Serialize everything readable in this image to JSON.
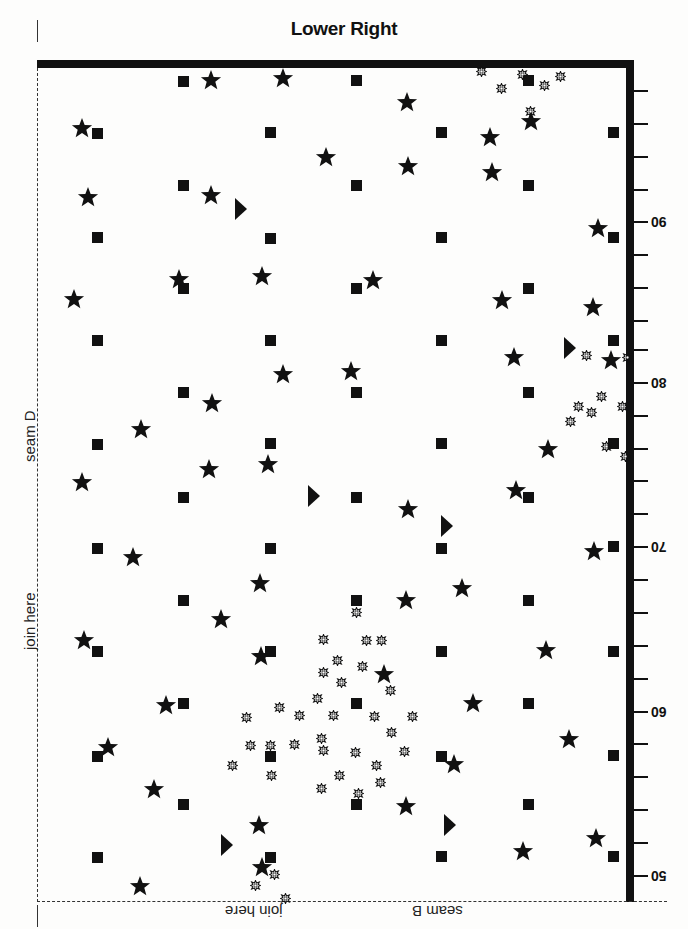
{
  "title": "Lower Right",
  "labels": {
    "left_seam": "seam D",
    "left_join": "join here",
    "bottom_join": "join here",
    "bottom_seam": "seam B"
  },
  "colors": {
    "ink": "#111111",
    "paper": "#fdfdfc"
  },
  "axis": {
    "side": "right",
    "orientation": "labels rotated 180deg",
    "ticks_y": [
      91,
      124,
      157,
      190,
      222,
      255,
      288,
      321,
      350,
      383,
      416,
      449,
      481,
      514,
      547,
      580,
      613,
      646,
      679,
      712,
      744,
      777,
      810,
      843,
      876
    ],
    "major": [
      {
        "label": "90",
        "y": 222
      },
      {
        "label": "80",
        "y": 383
      },
      {
        "label": "70",
        "y": 547
      },
      {
        "label": "60",
        "y": 712
      },
      {
        "label": "50",
        "y": 876
      }
    ]
  },
  "symbols": {
    "squares": [
      [
        183,
        81
      ],
      [
        356,
        80
      ],
      [
        528,
        80
      ],
      [
        97,
        133
      ],
      [
        270,
        132
      ],
      [
        441,
        132
      ],
      [
        613,
        132
      ],
      [
        183,
        185
      ],
      [
        356,
        185
      ],
      [
        528,
        185
      ],
      [
        97,
        237
      ],
      [
        270,
        238
      ],
      [
        441,
        237
      ],
      [
        613,
        237
      ],
      [
        183,
        288
      ],
      [
        356,
        288
      ],
      [
        528,
        288
      ],
      [
        97,
        340
      ],
      [
        270,
        340
      ],
      [
        441,
        340
      ],
      [
        613,
        340
      ],
      [
        183,
        392
      ],
      [
        356,
        392
      ],
      [
        528,
        392
      ],
      [
        97,
        444
      ],
      [
        270,
        443
      ],
      [
        441,
        443
      ],
      [
        613,
        443
      ],
      [
        183,
        497
      ],
      [
        356,
        497
      ],
      [
        528,
        497
      ],
      [
        97,
        548
      ],
      [
        270,
        548
      ],
      [
        441,
        548
      ],
      [
        613,
        546
      ],
      [
        183,
        600
      ],
      [
        356,
        600
      ],
      [
        528,
        600
      ],
      [
        97,
        651
      ],
      [
        270,
        651
      ],
      [
        441,
        651
      ],
      [
        613,
        651
      ],
      [
        183,
        703
      ],
      [
        356,
        703
      ],
      [
        528,
        703
      ],
      [
        97,
        756
      ],
      [
        270,
        756
      ],
      [
        441,
        756
      ],
      [
        613,
        755
      ],
      [
        183,
        804
      ],
      [
        356,
        804
      ],
      [
        528,
        804
      ],
      [
        97,
        857
      ],
      [
        270,
        857
      ],
      [
        441,
        856
      ],
      [
        613,
        856
      ]
    ],
    "stars": [
      [
        211,
        80
      ],
      [
        283,
        78
      ],
      [
        82,
        128
      ],
      [
        407,
        102
      ],
      [
        490,
        137
      ],
      [
        531,
        121
      ],
      [
        326,
        157
      ],
      [
        408,
        166
      ],
      [
        492,
        172
      ],
      [
        88,
        197
      ],
      [
        211,
        195
      ],
      [
        598,
        228
      ],
      [
        179,
        279
      ],
      [
        262,
        276
      ],
      [
        373,
        280
      ],
      [
        74,
        299
      ],
      [
        502,
        300
      ],
      [
        593,
        307
      ],
      [
        514,
        357
      ],
      [
        611,
        360
      ],
      [
        283,
        374
      ],
      [
        351,
        371
      ],
      [
        212,
        403
      ],
      [
        141,
        429
      ],
      [
        548,
        449
      ],
      [
        209,
        469
      ],
      [
        268,
        464
      ],
      [
        82,
        482
      ],
      [
        516,
        490
      ],
      [
        408,
        509
      ],
      [
        133,
        557
      ],
      [
        594,
        551
      ],
      [
        260,
        583
      ],
      [
        462,
        588
      ],
      [
        406,
        600
      ],
      [
        221,
        619
      ],
      [
        84,
        640
      ],
      [
        546,
        650
      ],
      [
        261,
        656
      ],
      [
        384,
        674
      ],
      [
        166,
        705
      ],
      [
        473,
        703
      ],
      [
        108,
        747
      ],
      [
        569,
        739
      ],
      [
        454,
        764
      ],
      [
        154,
        789
      ],
      [
        406,
        806
      ],
      [
        259,
        825
      ],
      [
        596,
        838
      ],
      [
        523,
        851
      ],
      [
        262,
        867
      ],
      [
        140,
        886
      ]
    ],
    "triangles": [
      [
        240,
        209
      ],
      [
        569,
        348
      ],
      [
        313,
        496
      ],
      [
        446,
        526
      ],
      [
        449,
        825
      ],
      [
        226,
        845
      ]
    ],
    "suns": [
      [
        481,
        68
      ],
      [
        522,
        71
      ],
      [
        560,
        73
      ],
      [
        501,
        85
      ],
      [
        544,
        82
      ],
      [
        530,
        108
      ],
      [
        586,
        352
      ],
      [
        627,
        354
      ],
      [
        601,
        393
      ],
      [
        578,
        403
      ],
      [
        591,
        409
      ],
      [
        570,
        418
      ],
      [
        622,
        403
      ],
      [
        606,
        443
      ],
      [
        625,
        453
      ],
      [
        356,
        609
      ],
      [
        323,
        636
      ],
      [
        366,
        637
      ],
      [
        381,
        637
      ],
      [
        337,
        657
      ],
      [
        362,
        663
      ],
      [
        323,
        669
      ],
      [
        341,
        679
      ],
      [
        390,
        687
      ],
      [
        317,
        695
      ],
      [
        279,
        704
      ],
      [
        246,
        714
      ],
      [
        299,
        712
      ],
      [
        333,
        712
      ],
      [
        374,
        713
      ],
      [
        412,
        713
      ],
      [
        391,
        729
      ],
      [
        321,
        735
      ],
      [
        323,
        747
      ],
      [
        250,
        742
      ],
      [
        270,
        742
      ],
      [
        294,
        741
      ],
      [
        355,
        749
      ],
      [
        404,
        748
      ],
      [
        232,
        762
      ],
      [
        376,
        762
      ],
      [
        271,
        772
      ],
      [
        339,
        772
      ],
      [
        380,
        779
      ],
      [
        321,
        785
      ],
      [
        358,
        790
      ],
      [
        274,
        871
      ],
      [
        255,
        882
      ],
      [
        285,
        895
      ]
    ]
  }
}
